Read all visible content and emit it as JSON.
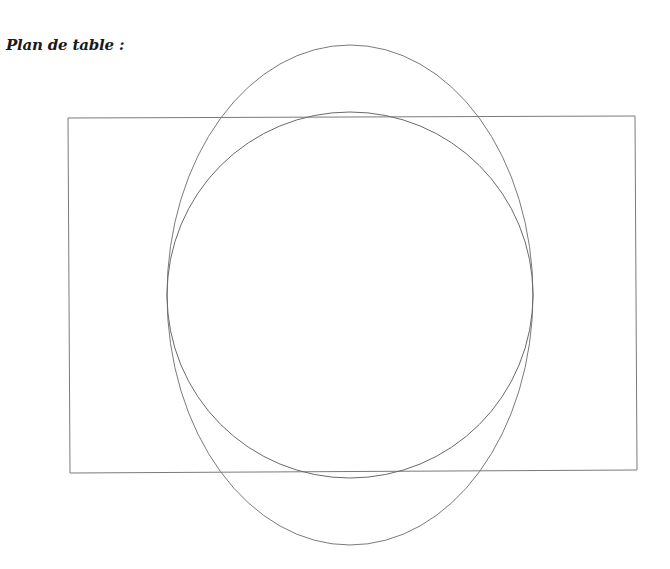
{
  "title": "Plan de table :",
  "diagram": {
    "stroke_color": "#7a7a7a",
    "shapes": [
      {
        "type": "rectangle",
        "name": "room-outline",
        "points": [
          [
            68,
            118
          ],
          [
            635,
            116
          ],
          [
            637,
            470
          ],
          [
            70,
            473
          ]
        ]
      },
      {
        "type": "ellipse",
        "name": "outer-ellipse",
        "cx": 350,
        "cy": 295,
        "rx": 183,
        "ry": 250
      },
      {
        "type": "circle",
        "name": "table-circle",
        "cx": 350,
        "cy": 295,
        "r": 183
      }
    ]
  }
}
